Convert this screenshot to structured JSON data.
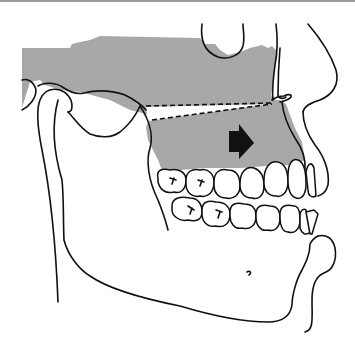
{
  "figure": {
    "colors": {
      "shaded_region": "#a8a8a8",
      "line": "#111111",
      "background": "#ffffff",
      "top_rule": "#9a9a9a"
    },
    "elements": [
      {
        "name": "maxilla-shaded-region",
        "description": "grey shaded upper jaw / midface region"
      },
      {
        "name": "osteotomy-dashed-lines",
        "description": "two dashed lines forming a wedge between mandibular ramus and anterior nasal spine"
      },
      {
        "name": "advancement-arrow",
        "description": "black arrow pointing forward (right) on maxilla"
      },
      {
        "name": "upper-teeth",
        "description": "maxillary dentition"
      },
      {
        "name": "lower-teeth",
        "description": "mandibular dentition"
      },
      {
        "name": "mandible-outline",
        "description": "lower jaw outline with mental foramen"
      },
      {
        "name": "soft-tissue-profile",
        "description": "nose, lips and chin soft tissue profile"
      },
      {
        "name": "condyle",
        "description": "mandibular condyle at TMJ"
      },
      {
        "name": "orbit-outline",
        "description": "lower orbit outline"
      }
    ]
  }
}
